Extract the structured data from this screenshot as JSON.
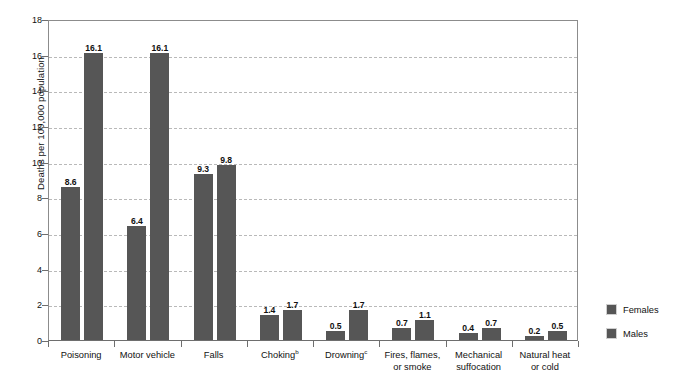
{
  "chart_data": {
    "type": "bar",
    "title": "",
    "subtitle": "",
    "xlabel": "",
    "ylabel": "Deaths per 100,000 population",
    "ylim": [
      0,
      18
    ],
    "ytick_step": 2,
    "yticks": [
      "18",
      "16",
      "14",
      "12",
      "10",
      "8",
      "6",
      "4",
      "2",
      "0"
    ],
    "grid": true,
    "grid_style": "dashed-horizontal",
    "legend_position": "right",
    "categories": [
      {
        "label": "Poisoning",
        "footnote": ""
      },
      {
        "label": "Motor vehicle",
        "footnote": ""
      },
      {
        "label": "Falls",
        "footnote": ""
      },
      {
        "label": "Choking",
        "footnote": "b"
      },
      {
        "label": "Drowning",
        "footnote": "c"
      },
      {
        "label": "Fires, flames,",
        "label2": "or smoke",
        "footnote": ""
      },
      {
        "label": "Mechanical",
        "label2": "suffocation",
        "footnote": ""
      },
      {
        "label": "Natural heat",
        "label2": "or cold",
        "footnote": ""
      }
    ],
    "series": [
      {
        "name": "Females",
        "color": "#565656",
        "values": [
          8.6,
          6.4,
          9.3,
          1.4,
          0.5,
          0.7,
          0.4,
          0.2
        ],
        "labels": [
          "8.6",
          "6.4",
          "9.3",
          "1.4",
          "0.5",
          "0.7",
          "0.4",
          "0.2"
        ]
      },
      {
        "name": "Males",
        "color": "#565656",
        "values": [
          16.1,
          16.1,
          9.8,
          1.7,
          1.7,
          1.1,
          0.7,
          0.5
        ],
        "labels": [
          "16.1",
          "16.1",
          "9.8",
          "1.7",
          "1.7",
          "1.1",
          "0.7",
          "0.5"
        ]
      }
    ]
  },
  "legend": {
    "items": [
      {
        "label": "Females",
        "color": "#565656"
      },
      {
        "label": "Males",
        "color": "#565656"
      }
    ]
  }
}
